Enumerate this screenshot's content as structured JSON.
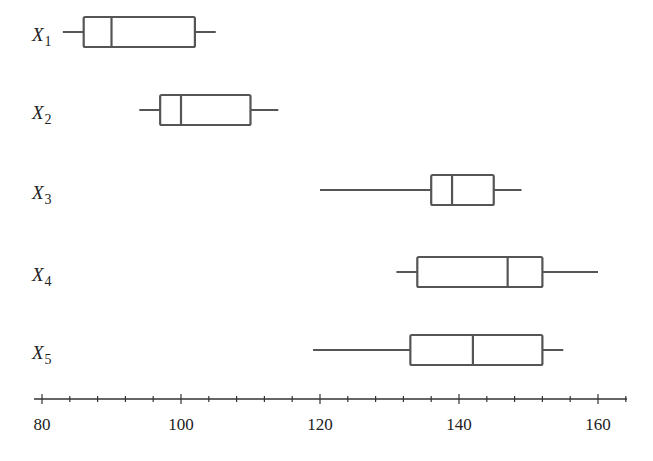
{
  "chart_data": {
    "type": "boxplot",
    "title": "",
    "xlabel": "",
    "ylabel": "",
    "xlim": [
      80,
      164
    ],
    "x_ticks": [
      80,
      100,
      120,
      140,
      160
    ],
    "minor_tick_step": 4,
    "grid": false,
    "orientation": "horizontal",
    "series": [
      {
        "name": "X1",
        "label_main": "X",
        "label_sub": "1",
        "min": 83,
        "q1": 86,
        "median": 90,
        "q3": 102,
        "max": 105
      },
      {
        "name": "X2",
        "label_main": "X",
        "label_sub": "2",
        "min": 94,
        "q1": 97,
        "median": 100,
        "q3": 110,
        "max": 114
      },
      {
        "name": "X3",
        "label_main": "X",
        "label_sub": "3",
        "min": 120,
        "q1": 136,
        "median": 139,
        "q3": 145,
        "max": 149
      },
      {
        "name": "X4",
        "label_main": "X",
        "label_sub": "4",
        "min": 131,
        "q1": 134,
        "median": 147,
        "q3": 152,
        "max": 160
      },
      {
        "name": "X5",
        "label_main": "X",
        "label_sub": "5",
        "min": 119,
        "q1": 133,
        "median": 142,
        "q3": 152,
        "max": 155
      }
    ],
    "colors": {
      "stroke": "#555555",
      "axis": "#333333",
      "text": "#222222"
    }
  }
}
